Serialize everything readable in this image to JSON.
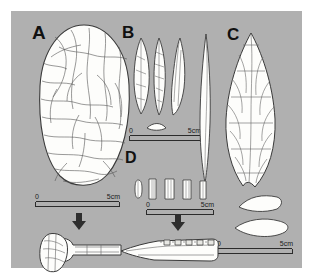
{
  "figure": {
    "background_color": "#b0b0b0",
    "page_color": "#ffffff",
    "ink_color": "#2b2b2b",
    "fill_color": "#fdfdfb"
  },
  "panels": [
    {
      "id": "A",
      "label": "A",
      "caption_artifact": "large oval bifacial axe / core tool, flaked surface",
      "scale": {
        "zero": "0",
        "far": "5cm"
      },
      "derivative": "hafted stone axe mounted on wooden handle"
    },
    {
      "id": "B",
      "label": "B",
      "caption_artifact": "three narrow backed points, with cross-section",
      "scale": {
        "zero": "0",
        "far": "5cm"
      }
    },
    {
      "id": "C",
      "label": "C",
      "caption_artifact": "leaf-shaped bifacial point, side profile and face view",
      "scale": {
        "zero": "0",
        "far": "5cm"
      },
      "derivative": "two lenticular cross-sections"
    },
    {
      "id": "D",
      "label": "D",
      "caption_artifact": "five small rectangular microliths",
      "scale": {
        "zero": "0",
        "far": "5cm"
      },
      "derivative": "composite spear / knife with inset microliths"
    }
  ],
  "arrows": [
    {
      "name": "arrow-a-to-haft",
      "direction": "down"
    },
    {
      "name": "arrow-d-to-composite",
      "direction": "down"
    }
  ]
}
